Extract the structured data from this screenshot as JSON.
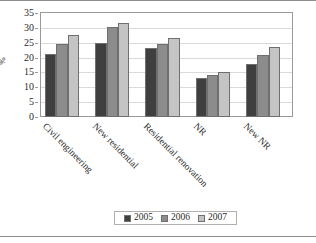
{
  "chart_data": {
    "type": "bar",
    "title": "",
    "subtitle": "",
    "xlabel": "",
    "ylabel": "%",
    "ylim": [
      0,
      35
    ],
    "yticks": [
      0,
      5,
      10,
      15,
      20,
      25,
      30,
      35
    ],
    "ytick_labels": [
      "0",
      "5",
      "10",
      "15",
      "20",
      "25",
      "30",
      "35"
    ],
    "grid": true,
    "legend_position": "bottom-center",
    "categories": [
      "Civil engineering",
      "New residential",
      "Residential renovation",
      "NR",
      "New NR"
    ],
    "series": [
      {
        "name": "2005",
        "color": "#3f3f3f",
        "values": [
          21.3,
          24.8,
          23.2,
          13.2,
          17.9
        ]
      },
      {
        "name": "2006",
        "color": "#8c8c8c",
        "values": [
          24.7,
          30.2,
          24.7,
          14.1,
          21.0
        ]
      },
      {
        "name": "2007",
        "color": "#c4c4c4",
        "values": [
          27.5,
          31.8,
          26.7,
          15.3,
          23.7
        ]
      }
    ]
  },
  "legend": {
    "entries": [
      {
        "label": "2005",
        "color": "#3f3f3f"
      },
      {
        "label": "2006",
        "color": "#8c8c8c"
      },
      {
        "label": "2007",
        "color": "#c4c4c4"
      }
    ]
  },
  "axes": {
    "y_title": "%"
  },
  "colors": {
    "frame": "#9a9a9a",
    "grid": "#d9d9d9",
    "bar_outline": "#6f6f6f",
    "text": "#2b2b2b",
    "background": "#ffffff"
  }
}
